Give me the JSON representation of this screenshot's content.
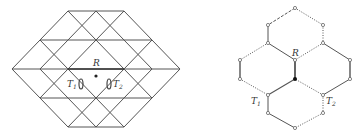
{
  "left_diagram": {
    "description": "Triangular lattice hexagon with site R and two tetrahedral/octahedral positions",
    "labels": {
      "R": "R",
      "T1_main": "T",
      "T1_sub": "1",
      "T2_main": "T",
      "T2_sub": "2"
    },
    "line_color": "#555555"
  },
  "right_diagram": {
    "description": "Honeycomb lattice of three hexagons with solid, dashed and dotted bonds",
    "labels": {
      "R": "R",
      "T1_main": "T",
      "T1_sub": "1",
      "T2_main": "T",
      "T2_sub": "2"
    },
    "line_color": "#555555"
  }
}
